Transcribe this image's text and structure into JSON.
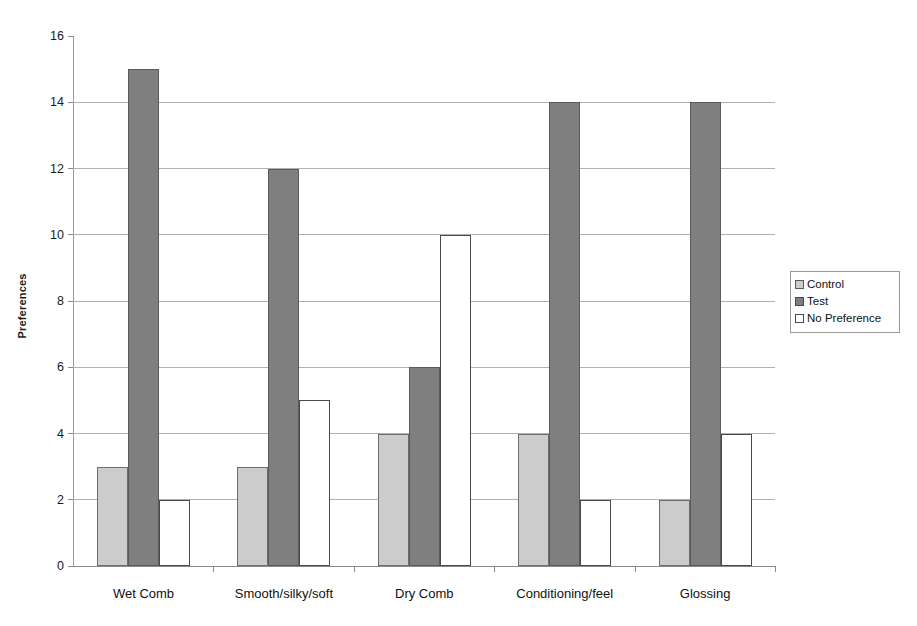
{
  "chart_data": {
    "type": "bar",
    "title": "",
    "subtitle": "",
    "xlabel": "",
    "ylabel": "Preferences",
    "ylim": [
      0,
      16
    ],
    "ytick_step": 2,
    "yticks": [
      0,
      2,
      4,
      6,
      8,
      10,
      12,
      14,
      16
    ],
    "ytick_labels": [
      "0",
      "2",
      "4",
      "6",
      "8",
      "10",
      "12",
      "14",
      "16"
    ],
    "grid": "horizontal",
    "legend_position": "right",
    "categories": [
      "Wet Comb",
      "Smooth/silky/soft",
      "Dry Comb",
      "Conditioning/feel",
      "Glossing"
    ],
    "series": [
      {
        "name": "Control",
        "color": "#cccccc",
        "edge_color": "#6d6d6d",
        "values": [
          3,
          3,
          4,
          4,
          2
        ]
      },
      {
        "name": "Test",
        "color": "#7f7f7f",
        "edge_color": "#5a5a5a",
        "values": [
          15,
          12,
          6,
          14,
          14
        ]
      },
      {
        "name": "No Preference",
        "color": "#ffffff",
        "edge_color": "#4a4a4a",
        "values": [
          2,
          5,
          10,
          2,
          4
        ]
      }
    ],
    "annotations": []
  },
  "legend": {
    "entries": [
      {
        "label": "Control",
        "swatch": "series-control"
      },
      {
        "label": "Test",
        "swatch": "series-test"
      },
      {
        "label": "No Preference",
        "swatch": "series-nopref"
      }
    ]
  },
  "axis": {
    "y_title": "Preferences"
  },
  "colors": {
    "control": "#cccccc",
    "test": "#7f7f7f",
    "no_preference": "#ffffff",
    "gridline": "#b0b0b0",
    "axis": "#8a8a8a",
    "text": "#111111",
    "background": "#ffffff"
  }
}
